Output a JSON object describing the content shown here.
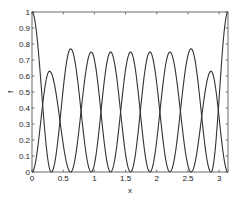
{
  "chart_data": {
    "type": "line",
    "title": "",
    "xlabel": "x",
    "ylabel": "f",
    "xlim": [
      0,
      3.1416
    ],
    "ylim": [
      0,
      1
    ],
    "grid": false,
    "legend": null,
    "x_ticks": [
      "0",
      "0.5",
      "1",
      "1.5",
      "2",
      "2.5",
      "3"
    ],
    "x_tick_values": [
      0,
      0.5,
      1,
      1.5,
      2,
      2.5,
      3
    ],
    "y_ticks": [
      "0",
      "0.1",
      "0.2",
      "0.3",
      "0.4",
      "0.5",
      "0.6",
      "0.7",
      "0.8",
      "0.9",
      "1"
    ],
    "y_tick_values": [
      0,
      0.1,
      0.2,
      0.3,
      0.4,
      0.5,
      0.6,
      0.7,
      0.8,
      0.9,
      1
    ],
    "line_color": "#333333",
    "series": [
      {
        "name": "basis-1",
        "peak_x": 0.0,
        "peak_y": 1.0,
        "zeros": [
          0.31
        ]
      },
      {
        "name": "basis-2",
        "peak_x": 0.28,
        "peak_y": 0.63,
        "zeros": [
          0.0,
          0.62
        ]
      },
      {
        "name": "basis-3",
        "peak_x": 0.62,
        "peak_y": 0.77,
        "zeros": [
          0.31,
          0.95
        ]
      },
      {
        "name": "basis-4",
        "peak_x": 0.95,
        "peak_y": 0.75,
        "zeros": [
          0.62,
          1.26
        ]
      },
      {
        "name": "basis-5",
        "peak_x": 1.26,
        "peak_y": 0.75,
        "zeros": [
          0.95,
          1.58
        ]
      },
      {
        "name": "basis-6",
        "peak_x": 1.58,
        "peak_y": 0.75,
        "zeros": [
          1.26,
          1.89
        ]
      },
      {
        "name": "basis-7",
        "peak_x": 1.89,
        "peak_y": 0.75,
        "zeros": [
          1.58,
          2.21
        ]
      },
      {
        "name": "basis-8",
        "peak_x": 2.21,
        "peak_y": 0.75,
        "zeros": [
          1.89,
          2.55
        ]
      },
      {
        "name": "basis-9",
        "peak_x": 2.55,
        "peak_y": 0.77,
        "zeros": [
          2.21,
          2.87
        ]
      },
      {
        "name": "basis-10",
        "peak_x": 2.87,
        "peak_y": 0.63,
        "zeros": [
          2.55,
          3.1416
        ]
      },
      {
        "name": "basis-11",
        "peak_x": 3.1416,
        "peak_y": 1.0,
        "zeros": [
          2.87
        ]
      }
    ]
  }
}
